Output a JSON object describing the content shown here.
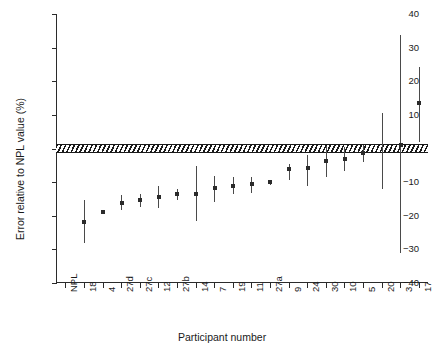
{
  "chart_data": {
    "type": "scatter",
    "title": "",
    "xlabel": "Participant number",
    "ylabel": "Error relative to NPL value (%)",
    "xlim": [
      0,
      20
    ],
    "ylim": [
      -40,
      40
    ],
    "yticks": [
      40,
      30,
      20,
      10,
      0,
      -10,
      -20,
      -30,
      -40
    ],
    "ytick_labels": [
      "40",
      "30",
      "20",
      "10",
      "0",
      "−10",
      "−20",
      "−30",
      "−40"
    ],
    "grid": false,
    "legend": null,
    "reference_band": {
      "label": "NPL uncertainty band",
      "low": -1.2,
      "high": 1.2,
      "fill": "hatched",
      "color": "#1a1a1a"
    },
    "categories": [
      "NPL",
      "18",
      "4",
      "27d",
      "27c",
      "12",
      "27b",
      "14",
      "7",
      "19",
      "11",
      "27a",
      "9",
      "24",
      "30",
      "10",
      "5",
      "20",
      "3",
      "17"
    ],
    "values": [
      null,
      -21.8,
      -18.8,
      -16.3,
      -15.4,
      -14.4,
      -13.6,
      -13.4,
      -11.6,
      -11.1,
      -10.7,
      -10.1,
      -6.1,
      -5.9,
      -3.7,
      -3.0,
      -1.4,
      null,
      1.0,
      13.4
    ],
    "err_low": [
      null,
      -28.1,
      -19.5,
      -18.4,
      -17.3,
      -17.8,
      -15.2,
      -21.7,
      -15.8,
      -13.6,
      -13.2,
      -10.9,
      -9.3,
      -11.2,
      -8.6,
      -6.6,
      -4.0,
      -11.9,
      -31.1,
      2.0
    ],
    "err_high": [
      null,
      -15.2,
      -18.2,
      -13.9,
      -13.6,
      -11.1,
      -12.0,
      -5.3,
      -8.2,
      -8.6,
      -8.6,
      -9.4,
      -4.6,
      -2.0,
      0.8,
      0.5,
      1.0,
      10.6,
      33.7,
      24.3
    ],
    "series": [
      {
        "name": "Participant error relative to NPL",
        "points": [
          {
            "category": "NPL",
            "value": null,
            "low": null,
            "high": null
          },
          {
            "category": "18",
            "value": -21.8,
            "low": -28.1,
            "high": -15.2
          },
          {
            "category": "4",
            "value": -18.8,
            "low": -19.5,
            "high": -18.2
          },
          {
            "category": "27d",
            "value": -16.3,
            "low": -18.4,
            "high": -13.9
          },
          {
            "category": "27c",
            "value": -15.4,
            "low": -17.3,
            "high": -13.6
          },
          {
            "category": "12",
            "value": -14.4,
            "low": -17.8,
            "high": -11.1
          },
          {
            "category": "27b",
            "value": -13.6,
            "low": -15.2,
            "high": -12.0
          },
          {
            "category": "14",
            "value": -13.4,
            "low": -21.7,
            "high": -5.3
          },
          {
            "category": "7",
            "value": -11.6,
            "low": -15.8,
            "high": -8.2
          },
          {
            "category": "19",
            "value": -11.1,
            "low": -13.6,
            "high": -8.6
          },
          {
            "category": "11",
            "value": -10.7,
            "low": -13.2,
            "high": -8.6
          },
          {
            "category": "27a",
            "value": -10.1,
            "low": -10.9,
            "high": -9.4
          },
          {
            "category": "9",
            "value": -6.1,
            "low": -9.3,
            "high": -4.6
          },
          {
            "category": "24",
            "value": -5.9,
            "low": -11.2,
            "high": -2.0
          },
          {
            "category": "30",
            "value": -3.7,
            "low": -8.6,
            "high": 0.8
          },
          {
            "category": "10",
            "value": -3.0,
            "low": -6.6,
            "high": 0.5
          },
          {
            "category": "5",
            "value": -1.4,
            "low": -4.0,
            "high": 1.0
          },
          {
            "category": "20",
            "value": null,
            "low": -11.9,
            "high": 10.6
          },
          {
            "category": "3",
            "value": 1.0,
            "low": -31.1,
            "high": 33.7
          },
          {
            "category": "17",
            "value": 13.4,
            "low": 2.0,
            "high": 24.3
          }
        ]
      }
    ]
  }
}
